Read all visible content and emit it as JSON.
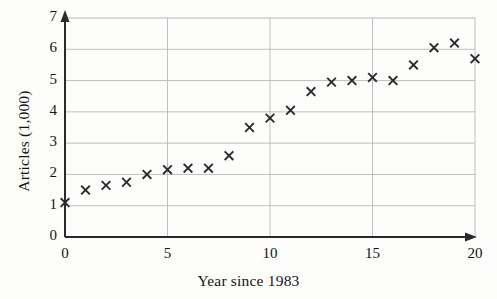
{
  "chart_data": {
    "type": "scatter",
    "title": "",
    "xlabel": "Year since 1983",
    "ylabel": "Articles (1,000)",
    "xlim": [
      0,
      20
    ],
    "ylim": [
      0,
      7
    ],
    "xticks": [
      "0",
      "5",
      "10",
      "15",
      "20"
    ],
    "xtick_values": [
      0,
      5,
      10,
      15,
      20
    ],
    "yticks": [
      "0",
      "1",
      "2",
      "3",
      "4",
      "5",
      "6",
      "7"
    ],
    "ytick_values": [
      0,
      1,
      2,
      3,
      4,
      5,
      6,
      7
    ],
    "grid": true,
    "legend": null,
    "marker": "x",
    "marker_color": "#2b2b2b",
    "x": [
      0,
      1,
      2,
      3,
      4,
      5,
      6,
      7,
      8,
      9,
      10,
      11,
      12,
      13,
      14,
      15,
      16,
      17,
      18,
      19,
      20
    ],
    "y": [
      1.1,
      1.5,
      1.65,
      1.75,
      2.0,
      2.15,
      2.2,
      2.2,
      2.6,
      3.5,
      3.8,
      4.05,
      4.65,
      4.95,
      5.0,
      5.1,
      5.0,
      5.5,
      6.05,
      6.2,
      5.7
    ],
    "series": [
      {
        "name": "Articles",
        "points": [
          {
            "x": 0,
            "y": 1.1
          },
          {
            "x": 1,
            "y": 1.5
          },
          {
            "x": 2,
            "y": 1.65
          },
          {
            "x": 3,
            "y": 1.75
          },
          {
            "x": 4,
            "y": 2.0
          },
          {
            "x": 5,
            "y": 2.15
          },
          {
            "x": 6,
            "y": 2.2
          },
          {
            "x": 7,
            "y": 2.2
          },
          {
            "x": 8,
            "y": 2.6
          },
          {
            "x": 9,
            "y": 3.5
          },
          {
            "x": 10,
            "y": 3.8
          },
          {
            "x": 11,
            "y": 4.05
          },
          {
            "x": 12,
            "y": 4.65
          },
          {
            "x": 13,
            "y": 4.95
          },
          {
            "x": 14,
            "y": 5.0
          },
          {
            "x": 15,
            "y": 5.1
          },
          {
            "x": 16,
            "y": 5.0
          },
          {
            "x": 17,
            "y": 5.5
          },
          {
            "x": 18,
            "y": 6.05
          },
          {
            "x": 19,
            "y": 6.2
          },
          {
            "x": 20,
            "y": 5.7
          }
        ]
      }
    ],
    "colors": {
      "background": "#fdfdfc",
      "axis": "#2a2a2a",
      "grid": "#b8b8b8",
      "marker": "#2b2b2b",
      "text": "#141414"
    },
    "axis_style": {
      "x_axis_arrow": true,
      "y_axis_arrow": true,
      "gridlines_x_at": [
        5,
        10,
        15,
        20
      ],
      "gridlines_y_at": [
        1,
        2,
        3,
        4,
        5,
        6,
        7
      ]
    }
  }
}
